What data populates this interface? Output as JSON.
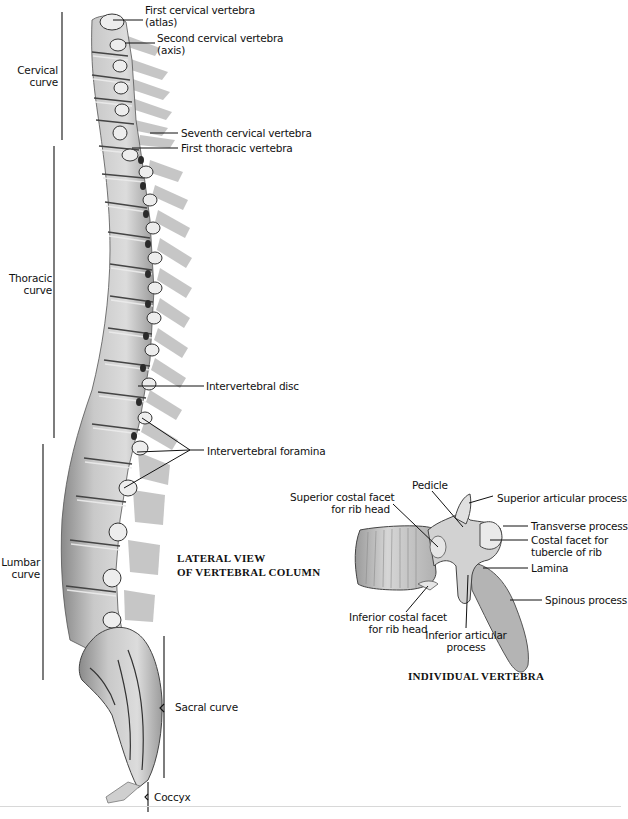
{
  "figure": {
    "lateral_view": {
      "caption_line1": "LATERAL VIEW",
      "caption_line2": "OF VERTEBRAL COLUMN",
      "curves": {
        "cervical": [
          "Cervical",
          "curve"
        ],
        "thoracic": [
          "Thoracic",
          "curve"
        ],
        "lumbar": [
          "Lumbar",
          "curve"
        ],
        "sacral": "Sacral curve",
        "coccyx": "Coccyx"
      },
      "labels": {
        "first_cervical": [
          "First cervical vertebra",
          "(atlas)"
        ],
        "second_cervical": [
          "Second cervical vertebra",
          "(axis)"
        ],
        "seventh_cervical": "Seventh cervical vertebra",
        "first_thoracic": "First thoracic vertebra",
        "intervertebral_disc": "Intervertebral disc",
        "intervertebral_foramina": "Intervertebral foramina"
      }
    },
    "individual_vertebra": {
      "caption": "INDIVIDUAL VERTEBRA",
      "labels": {
        "pedicle": "Pedicle",
        "superior_costal_facet": [
          "Superior costal facet",
          "for rib head"
        ],
        "superior_articular_process": "Superior articular process",
        "transverse_process": "Transverse process",
        "costal_facet_tubercle": [
          "Costal facet for",
          "tubercle of rib"
        ],
        "lamina": "Lamina",
        "spinous_process": "Spinous process",
        "inferior_costal_facet": [
          "Inferior costal facet",
          "for rib head"
        ],
        "inferior_articular_process": [
          "Inferior articular",
          "process"
        ]
      }
    },
    "colors": {
      "bone_light": "#e4e4e4",
      "bone_mid": "#b9b9b9",
      "bone_dark": "#6e6e6e",
      "ink": "#111111"
    }
  }
}
